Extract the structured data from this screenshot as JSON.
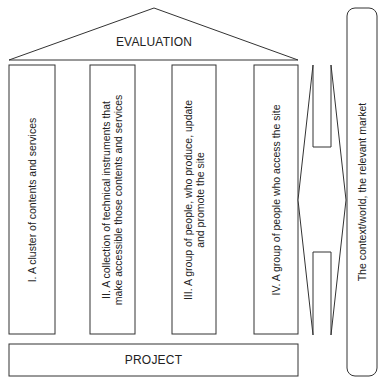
{
  "roof": {
    "label": "EVALUATION"
  },
  "pillars": [
    {
      "id": "I",
      "lines": [
        "I. A cluster of contents and services"
      ]
    },
    {
      "id": "II",
      "lines": [
        "II. A collection of technical instruments that",
        "make accessible those contents and services"
      ]
    },
    {
      "id": "III",
      "lines": [
        "III. A group of people, who produce, update",
        "and promote the site"
      ]
    },
    {
      "id": "IV",
      "lines": [
        "IV. A group of people who access the site"
      ]
    }
  ],
  "foundation": {
    "label": "PROJECT"
  },
  "context": {
    "label": "The context/world, the relevant market"
  },
  "arrow": {
    "type": "double-headed-vertical-arrow"
  }
}
